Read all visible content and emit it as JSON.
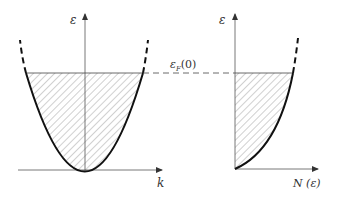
{
  "diagram": {
    "left_panel": {
      "y_axis_label": "ε",
      "x_axis_label": "k",
      "description": "Parabolic dispersion ε(k) with occupied states hatched up to the Fermi level"
    },
    "right_panel": {
      "y_axis_label": "ε",
      "x_axis_label": "N (ε)",
      "description": "Density of states N(ε) filled (hatched) up to the Fermi energy"
    },
    "fermi_level_label": "ε",
    "fermi_level_subscript": "F",
    "fermi_level_arg": "(0)",
    "colors": {
      "curve": "#111111",
      "axis": "#555555",
      "hatch": "#888888",
      "background": "#ffffff"
    }
  }
}
